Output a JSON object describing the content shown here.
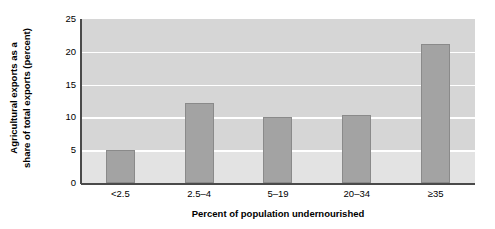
{
  "chart_data": {
    "type": "bar",
    "title": "",
    "categories": [
      "<2.5",
      "2.5–4",
      "5–19",
      "20–34",
      "≥35"
    ],
    "values": [
      5.0,
      12.2,
      10.0,
      10.3,
      21.2
    ],
    "xlabel": "Percent of population undernourished",
    "ylabel_lines": [
      "Agricultural exports as a",
      "share of total exports (percent)"
    ],
    "ylabel": "Agricultural exports as a share of total exports (percent)",
    "ylim": [
      0,
      25
    ],
    "yticks": [
      25,
      20,
      15,
      10,
      5,
      0
    ],
    "gridlines": [
      20,
      15,
      10,
      5
    ],
    "grid": true,
    "legend": "none",
    "colors": {
      "bar_fill": "#a3a3a3",
      "bar_edge": "#8a8a8a",
      "plot_background": "#d6d6d6",
      "plot_background_low": "#e3e3e3",
      "gridline": "#ffffff",
      "axis": "#4a4a4a",
      "text": "#000000"
    }
  }
}
